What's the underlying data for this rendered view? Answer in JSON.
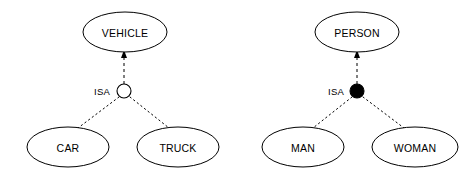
{
  "diagram": {
    "type": "er-isa-hierarchy",
    "background_color": "#ffffff",
    "line_color": "#000000",
    "width": 473,
    "height": 179,
    "groups": [
      {
        "id": "vehicle-group",
        "superclass": {
          "label": "VEHICLE",
          "cx": 125,
          "cy": 32,
          "rx": 42,
          "ry": 20
        },
        "isa": {
          "label": "ISA",
          "label_x": 110,
          "label_y": 91,
          "junction_cx": 124,
          "junction_cy": 91,
          "junction_r": 7,
          "junction_style": "hollow",
          "junction_fill": "#ffffff"
        },
        "subclasses": [
          {
            "label": "CAR",
            "cx": 68,
            "cy": 147,
            "rx": 41,
            "ry": 20
          },
          {
            "label": "TRUCK",
            "cx": 178,
            "cy": 147,
            "rx": 41,
            "ry": 20
          }
        ]
      },
      {
        "id": "person-group",
        "superclass": {
          "label": "PERSON",
          "cx": 357,
          "cy": 32,
          "rx": 42,
          "ry": 20
        },
        "isa": {
          "label": "ISA",
          "label_x": 344,
          "label_y": 91,
          "junction_cx": 357,
          "junction_cy": 91,
          "junction_r": 7,
          "junction_style": "filled",
          "junction_fill": "#000000"
        },
        "subclasses": [
          {
            "label": "MAN",
            "cx": 303,
            "cy": 147,
            "rx": 41,
            "ry": 20
          },
          {
            "label": "WOMAN",
            "cx": 415,
            "cy": 147,
            "rx": 43,
            "ry": 20
          }
        ]
      }
    ]
  }
}
